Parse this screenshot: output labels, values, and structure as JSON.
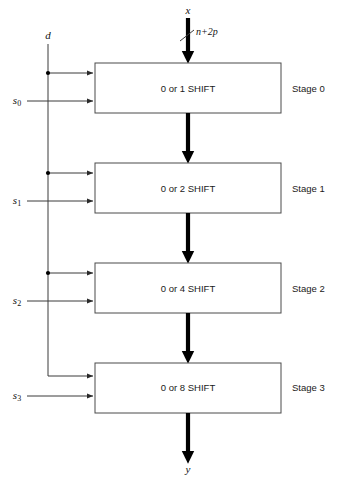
{
  "figure": {
    "colors": {
      "background": "#ffffff",
      "box_stroke": "#4a4a4a",
      "thin_line": "#3a3a3a",
      "thick_arrow": "#000000",
      "text": "#1a1a1a"
    }
  },
  "signals": {
    "input_label": "x",
    "input_width_label": "n+2p",
    "output_label": "y",
    "control_label": "d",
    "select_labels": [
      "s",
      "s",
      "s",
      "s"
    ],
    "select_subscripts": [
      "0",
      "1",
      "2",
      "3"
    ]
  },
  "stages": [
    {
      "box_label": "0 or 1 SHIFT",
      "stage_label": "Stage 0",
      "select_label": "s",
      "select_subscript": "0"
    },
    {
      "box_label": "0 or 2 SHIFT",
      "stage_label": "Stage 1",
      "select_label": "s",
      "select_subscript": "1"
    },
    {
      "box_label": "0 or 4  SHIFT",
      "stage_label": "Stage 2",
      "select_label": "s",
      "select_subscript": "2"
    },
    {
      "box_label": "0 or 8  SHIFT",
      "stage_label": "Stage 3",
      "select_label": "s",
      "select_subscript": "3"
    }
  ],
  "geometry": {
    "box_left": 95,
    "box_right": 281,
    "box_width": 186,
    "box_tops": [
      63,
      163,
      263,
      363
    ],
    "box_height": 50,
    "data_path_x": 188,
    "control_line_x": 48,
    "stage_label_x": 292
  }
}
